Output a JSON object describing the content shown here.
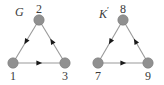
{
  "figure": {
    "background_color": "#ffffff",
    "node_color": "#909090",
    "node_stroke_color": "#7a7a7a",
    "edge_color": "#9a9a9a",
    "arrow_color": "#1a1a1a",
    "text_color": "#3a3a3a",
    "node_radius": 5.2
  },
  "graphs": [
    {
      "id": "graph-g",
      "title": "G",
      "title_prime": "",
      "title_x": 15,
      "title_y": 6,
      "nodes": [
        {
          "id": "n1",
          "label": "1",
          "x": 13,
          "y": 63,
          "label_x": 6,
          "label_y": 70
        },
        {
          "id": "n2",
          "label": "2",
          "x": 39,
          "y": 20,
          "label_x": 32,
          "label_y": 3
        },
        {
          "id": "n3",
          "label": "3",
          "x": 65,
          "y": 63,
          "label_x": 58,
          "label_y": 70
        }
      ],
      "edges": [
        {
          "id": "e-2-1",
          "from": "n2",
          "to": "n1",
          "source_label": "2",
          "target_label": "1",
          "arrow_at": 0.5,
          "arrow_direction": "down-left"
        },
        {
          "id": "e-3-2",
          "from": "n3",
          "to": "n2",
          "source_label": "3",
          "target_label": "2",
          "arrow_at": 0.5,
          "arrow_direction": "up-left"
        },
        {
          "id": "e-1-3",
          "from": "n1",
          "to": "n3",
          "source_label": "1",
          "target_label": "3",
          "arrow_at": 0.5,
          "arrow_direction": "right"
        }
      ]
    },
    {
      "id": "graph-k",
      "title": "K",
      "title_prime": "′",
      "title_x": 99,
      "title_y": 6,
      "nodes": [
        {
          "id": "n7",
          "label": "7",
          "x": 98,
          "y": 63,
          "label_x": 91,
          "label_y": 70
        },
        {
          "id": "n8",
          "label": "8",
          "x": 123,
          "y": 20,
          "label_x": 116,
          "label_y": 3
        },
        {
          "id": "n9",
          "label": "9",
          "x": 148,
          "y": 63,
          "label_x": 141,
          "label_y": 70
        }
      ],
      "edges": [
        {
          "id": "e-8-7",
          "from": "n8",
          "to": "n7",
          "source_label": "8",
          "target_label": "7",
          "arrow_at": 0.5,
          "arrow_direction": "down-left"
        },
        {
          "id": "e-9-8",
          "from": "n9",
          "to": "n8",
          "source_label": "9",
          "target_label": "8",
          "arrow_at": 0.5,
          "arrow_direction": "up-left"
        },
        {
          "id": "e-7-9",
          "from": "n7",
          "to": "n9",
          "source_label": "7",
          "target_label": "9",
          "arrow_at": 0.5,
          "arrow_direction": "right"
        }
      ]
    }
  ]
}
